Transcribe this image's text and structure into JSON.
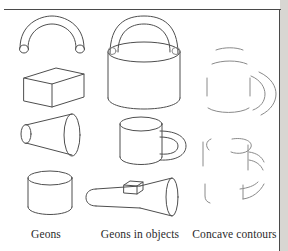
{
  "figure": {
    "type": "line-drawing-illustration",
    "background_color": "#ffffff",
    "stroke_color": "#4e4e4e",
    "faint_stroke_color": "#8a8a8a",
    "gutter_color": "#d8d6d2",
    "columns": [
      {
        "label": "Geons",
        "items": [
          {
            "name": "curved-arch-geon",
            "shape": "bent cylinder / arch"
          },
          {
            "name": "brick-geon",
            "shape": "rectangular block"
          },
          {
            "name": "truncated-cone-geon",
            "shape": "expanded cone / frustum"
          },
          {
            "name": "cylinder-geon",
            "shape": "straight cylinder"
          }
        ]
      },
      {
        "label": "Geons in objects",
        "items": [
          {
            "name": "bucket-object",
            "shape": "pail with arch handle"
          },
          {
            "name": "mug-object",
            "shape": "cup with curved handle"
          },
          {
            "name": "flashlight-object",
            "shape": "torch with cone head and switch"
          }
        ]
      },
      {
        "label": "Concave contours",
        "items": [
          {
            "name": "mug-concave-contours-top",
            "shape": "fragmented mug contours"
          },
          {
            "name": "mug-concave-contours-middle",
            "shape": "partial cylinder and handle junction"
          },
          {
            "name": "mug-concave-contours-bottom",
            "shape": "sparse contour fragments"
          }
        ]
      }
    ]
  }
}
